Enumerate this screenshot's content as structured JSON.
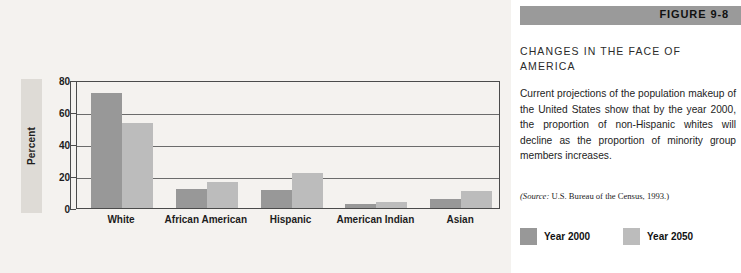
{
  "figure": {
    "banner_label": "FIGURE 9-8",
    "title": "CHANGES IN THE FACE OF AMERICA",
    "body": "Current projections of the population makeup of the United States show that by the year 2000, the proportion of non-Hispanic whites will decline as the proportion of minority group members increases.",
    "source_prefix": "(Source:",
    "source_text": " U.S. Bureau of the Census, 1993.)"
  },
  "colors": {
    "bar_2000": "#989898",
    "bar_2050": "#bcbcbc",
    "banner": "#9a9a9a",
    "chart_background": "#f4f2ef",
    "panel_background": "#ffffff",
    "axis": "#4b4b4b",
    "gridline": "#6b6b6b"
  },
  "chart_data": {
    "type": "bar",
    "title": "",
    "xlabel": "",
    "ylabel": "Percent",
    "ylim": [
      0,
      80
    ],
    "yticks": [
      0,
      20,
      40,
      60,
      80
    ],
    "ytick_labels": [
      "0",
      "20",
      "40",
      "60",
      "80"
    ],
    "grid": true,
    "legend_position": "outside-right-bottom",
    "categories": [
      "White",
      "African American",
      "Hispanic",
      "American Indian",
      "Asian"
    ],
    "series": [
      {
        "name": "Year 2000",
        "color": "#989898",
        "values": [
          72,
          12,
          11,
          2.5,
          5.5
        ]
      },
      {
        "name": "Year 2050",
        "color": "#bcbcbc",
        "values": [
          53,
          16.5,
          22,
          3.5,
          10.5
        ]
      }
    ]
  },
  "legend": {
    "entries": [
      {
        "label": "Year 2000",
        "color": "#989898"
      },
      {
        "label": "Year 2050",
        "color": "#bcbcbc"
      }
    ]
  }
}
